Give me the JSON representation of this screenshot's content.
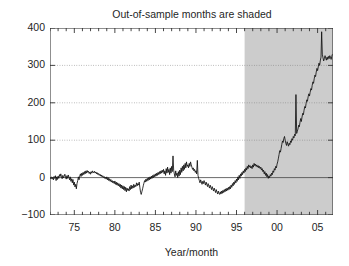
{
  "chart_data": {
    "type": "line",
    "title": "Out-of-sample months are shaded",
    "xlabel": "Year/month",
    "ylabel": "",
    "xlim": [
      1972.0,
      2006.9
    ],
    "ylim": [
      -100,
      400
    ],
    "grid": true,
    "legend_position": "none",
    "yticks": [
      -100,
      0,
      100,
      200,
      300,
      400
    ],
    "ytick_labels": [
      "−100",
      "0",
      "100",
      "200",
      "300",
      "400"
    ],
    "xticks": [
      1975,
      1980,
      1985,
      1990,
      1995,
      2000,
      2005
    ],
    "xtick_labels": [
      "75",
      "80",
      "85",
      "90",
      "95",
      "00",
      "05"
    ],
    "xminor_tick_interval": 1,
    "annotations": [
      {
        "kind": "shaded-region",
        "label": "Out-of-sample months",
        "x_start": 1996.0,
        "x_end": 2006.9,
        "color": "#cccccc"
      },
      {
        "kind": "reference-line",
        "label": "zero line",
        "y": 0
      }
    ],
    "series": [
      {
        "name": "cumulative series",
        "color": "#111111",
        "x": [
          1972.0,
          1972.08,
          1972.17,
          1972.25,
          1972.33,
          1972.42,
          1972.5,
          1972.58,
          1972.67,
          1972.75,
          1972.83,
          1972.92,
          1973.0,
          1973.08,
          1973.17,
          1973.25,
          1973.33,
          1973.42,
          1973.5,
          1973.58,
          1973.67,
          1973.75,
          1973.83,
          1973.92,
          1974.0,
          1974.08,
          1974.17,
          1974.25,
          1974.33,
          1974.42,
          1974.5,
          1974.58,
          1974.67,
          1974.75,
          1974.83,
          1974.92,
          1975.0,
          1975.08,
          1975.17,
          1975.25,
          1975.33,
          1975.42,
          1975.5,
          1975.58,
          1975.67,
          1975.75,
          1975.83,
          1975.92,
          1976.0,
          1976.08,
          1976.17,
          1976.25,
          1976.33,
          1976.42,
          1976.5,
          1976.58,
          1976.67,
          1976.75,
          1976.83,
          1976.92,
          1977.0,
          1977.08,
          1977.17,
          1977.25,
          1977.33,
          1977.42,
          1977.5,
          1977.58,
          1977.67,
          1977.75,
          1977.83,
          1977.92,
          1978.0,
          1978.08,
          1978.17,
          1978.25,
          1978.33,
          1978.42,
          1978.5,
          1978.58,
          1978.67,
          1978.75,
          1978.83,
          1978.92,
          1979.0,
          1979.08,
          1979.17,
          1979.25,
          1979.33,
          1979.42,
          1979.5,
          1979.58,
          1979.67,
          1979.75,
          1979.83,
          1979.92,
          1980.0,
          1980.08,
          1980.17,
          1980.25,
          1980.33,
          1980.42,
          1980.5,
          1980.58,
          1980.67,
          1980.75,
          1980.83,
          1980.92,
          1981.0,
          1981.08,
          1981.17,
          1981.25,
          1981.33,
          1981.42,
          1981.5,
          1981.58,
          1981.67,
          1981.75,
          1981.83,
          1981.92,
          1982.0,
          1982.08,
          1982.17,
          1982.25,
          1982.33,
          1982.42,
          1982.5,
          1982.58,
          1982.67,
          1982.75,
          1982.83,
          1982.92,
          1983.0,
          1983.08,
          1983.17,
          1983.25,
          1983.33,
          1983.42,
          1983.5,
          1983.58,
          1983.67,
          1983.75,
          1983.83,
          1983.92,
          1984.0,
          1984.08,
          1984.17,
          1984.25,
          1984.33,
          1984.42,
          1984.5,
          1984.58,
          1984.67,
          1984.75,
          1984.83,
          1984.92,
          1985.0,
          1985.08,
          1985.17,
          1985.25,
          1985.33,
          1985.42,
          1985.5,
          1985.58,
          1985.67,
          1985.75,
          1985.83,
          1985.92,
          1986.0,
          1986.08,
          1986.17,
          1986.25,
          1986.33,
          1986.42,
          1986.5,
          1986.58,
          1986.67,
          1986.75,
          1986.83,
          1986.92,
          1987.0,
          1987.08,
          1987.17,
          1987.25,
          1987.33,
          1987.42,
          1987.5,
          1987.58,
          1987.67,
          1987.75,
          1987.83,
          1987.92,
          1988.0,
          1988.08,
          1988.17,
          1988.25,
          1988.33,
          1988.42,
          1988.5,
          1988.58,
          1988.67,
          1988.75,
          1988.83,
          1988.92,
          1989.0,
          1989.08,
          1989.17,
          1989.25,
          1989.33,
          1989.42,
          1989.5,
          1989.58,
          1989.67,
          1989.75,
          1989.83,
          1989.92,
          1990.0,
          1990.08,
          1990.17,
          1990.25,
          1990.33,
          1990.42,
          1990.5,
          1990.58,
          1990.67,
          1990.75,
          1990.83,
          1990.92,
          1991.0,
          1991.08,
          1991.17,
          1991.25,
          1991.33,
          1991.42,
          1991.5,
          1991.58,
          1991.67,
          1991.75,
          1991.83,
          1991.92,
          1992.0,
          1992.08,
          1992.17,
          1992.25,
          1992.33,
          1992.42,
          1992.5,
          1992.58,
          1992.67,
          1992.75,
          1992.83,
          1992.92,
          1993.0,
          1993.08,
          1993.17,
          1993.25,
          1993.33,
          1993.42,
          1993.5,
          1993.58,
          1993.67,
          1993.75,
          1993.83,
          1993.92,
          1994.0,
          1994.08,
          1994.17,
          1994.25,
          1994.33,
          1994.42,
          1994.5,
          1994.58,
          1994.67,
          1994.75,
          1994.83,
          1994.92,
          1995.0,
          1995.08,
          1995.17,
          1995.25,
          1995.33,
          1995.42,
          1995.5,
          1995.58,
          1995.67,
          1995.75,
          1995.83,
          1995.92,
          1996.0,
          1996.08,
          1996.17,
          1996.25,
          1996.33,
          1996.42,
          1996.5,
          1996.58,
          1996.67,
          1996.75,
          1996.83,
          1996.92,
          1997.0,
          1997.08,
          1997.17,
          1997.25,
          1997.33,
          1997.42,
          1997.5,
          1997.58,
          1997.67,
          1997.75,
          1997.83,
          1997.92,
          1998.0,
          1998.08,
          1998.17,
          1998.25,
          1998.33,
          1998.42,
          1998.5,
          1998.58,
          1998.67,
          1998.75,
          1998.83,
          1998.92,
          1999.0,
          1999.08,
          1999.17,
          1999.25,
          1999.33,
          1999.42,
          1999.5,
          1999.58,
          1999.67,
          1999.75,
          1999.83,
          1999.92,
          2000.0,
          2000.08,
          2000.17,
          2000.25,
          2000.33,
          2000.42,
          2000.5,
          2000.58,
          2000.67,
          2000.75,
          2000.83,
          2000.92,
          2001.0,
          2001.08,
          2001.17,
          2001.25,
          2001.33,
          2001.42,
          2001.5,
          2001.58,
          2001.67,
          2001.75,
          2001.83,
          2001.92,
          2002.0,
          2002.08,
          2002.17,
          2002.25,
          2002.33,
          2002.42,
          2002.5,
          2002.58,
          2002.67,
          2002.75,
          2002.83,
          2002.92,
          2003.0,
          2003.08,
          2003.17,
          2003.25,
          2003.33,
          2003.42,
          2003.5,
          2003.58,
          2003.67,
          2003.75,
          2003.83,
          2003.92,
          2004.0,
          2004.08,
          2004.17,
          2004.25,
          2004.33,
          2004.42,
          2004.5,
          2004.58,
          2004.67,
          2004.75,
          2004.83,
          2004.92,
          2005.0,
          2005.08,
          2005.17,
          2005.25,
          2005.33,
          2005.42,
          2005.5,
          2005.58,
          2005.67,
          2005.75,
          2005.83,
          2005.92,
          2006.0,
          2006.08,
          2006.17,
          2006.25,
          2006.33,
          2006.42,
          2006.5,
          2006.58,
          2006.67,
          2006.75,
          2006.83
        ],
        "y": [
          0,
          -3,
          2,
          -4,
          1,
          -6,
          3,
          -2,
          5,
          -8,
          2,
          -5,
          4,
          -2,
          8,
          3,
          10,
          2,
          -3,
          6,
          -1,
          4,
          9,
          2,
          -4,
          5,
          -2,
          7,
          1,
          -6,
          2,
          -10,
          -3,
          -14,
          -5,
          -20,
          -12,
          -25,
          -18,
          -30,
          -16,
          -8,
          2,
          -6,
          4,
          10,
          3,
          12,
          6,
          14,
          8,
          16,
          10,
          18,
          12,
          19,
          14,
          17,
          11,
          15,
          9,
          16,
          12,
          18,
          14,
          13,
          17,
          12,
          15,
          10,
          13,
          8,
          11,
          6,
          9,
          4,
          7,
          2,
          5,
          0,
          3,
          -2,
          1,
          -4,
          2,
          -6,
          0,
          -8,
          -3,
          -10,
          -5,
          -12,
          -8,
          -14,
          -10,
          -16,
          -9,
          -18,
          -12,
          -20,
          -14,
          -22,
          -16,
          -24,
          -18,
          -28,
          -20,
          -30,
          -22,
          -32,
          -24,
          -35,
          -26,
          -38,
          -28,
          -34,
          -30,
          -36,
          -24,
          -32,
          -20,
          -30,
          -22,
          -28,
          -18,
          -26,
          -20,
          -24,
          -14,
          -22,
          -16,
          -20,
          -12,
          -26,
          -40,
          -45,
          -38,
          -30,
          -22,
          -15,
          -8,
          -12,
          -4,
          -10,
          -2,
          -8,
          0,
          -6,
          2,
          -4,
          4,
          -2,
          6,
          0,
          8,
          2,
          10,
          4,
          12,
          6,
          14,
          8,
          16,
          10,
          18,
          12,
          20,
          14,
          22,
          10,
          18,
          6,
          24,
          12,
          28,
          14,
          22,
          8,
          26,
          12,
          30,
          16,
          58,
          20,
          10,
          2,
          18,
          6,
          12,
          0,
          16,
          4,
          20,
          8,
          26,
          14,
          30,
          18,
          34,
          22,
          38,
          26,
          42,
          30,
          34,
          26,
          38,
          30,
          42,
          34,
          28,
          22,
          26,
          18,
          22,
          14,
          18,
          10,
          46,
          6,
          -2,
          -8,
          -14,
          -6,
          -12,
          -18,
          -10,
          -16,
          -8,
          -14,
          -20,
          -12,
          -18,
          -24,
          -16,
          -22,
          -28,
          -20,
          -26,
          -32,
          -24,
          -30,
          -36,
          -28,
          -34,
          -40,
          -32,
          -38,
          -44,
          -36,
          -42,
          -45,
          -38,
          -44,
          -36,
          -42,
          -34,
          -40,
          -32,
          -38,
          -30,
          -36,
          -28,
          -34,
          -26,
          -32,
          -24,
          -30,
          -20,
          -26,
          -16,
          -22,
          -12,
          -18,
          -8,
          -14,
          -4,
          -10,
          2,
          -6,
          6,
          -2,
          10,
          4,
          14,
          8,
          18,
          12,
          22,
          16,
          26,
          20,
          30,
          24,
          34,
          28,
          32,
          26,
          30,
          24,
          34,
          28,
          38,
          32,
          36,
          30,
          34,
          28,
          32,
          26,
          30,
          24,
          28,
          20,
          24,
          16,
          20,
          10,
          16,
          6,
          12,
          2,
          8,
          -2,
          4,
          0,
          8,
          4,
          12,
          8,
          18,
          14,
          24,
          20,
          30,
          26,
          36,
          42,
          52,
          62,
          72,
          68,
          78,
          88,
          98,
          94,
          104,
          110,
          100,
          92,
          86,
          96,
          90,
          84,
          92,
          88,
          98,
          94,
          104,
          100,
          110,
          106,
          116,
          112,
          222,
          118,
          124,
          130,
          140,
          136,
          148,
          158,
          150,
          162,
          172,
          168,
          180,
          190,
          186,
          198,
          208,
          204,
          216,
          224,
          218,
          228,
          238,
          234,
          246,
          256,
          252,
          264,
          274,
          270,
          282,
          292,
          286,
          296,
          306,
          300,
          312,
          322,
          390,
          330,
          320,
          312,
          318,
          326,
          320,
          314,
          322,
          316,
          324,
          318,
          326,
          322,
          316,
          324,
          330
        ]
      }
    ]
  }
}
